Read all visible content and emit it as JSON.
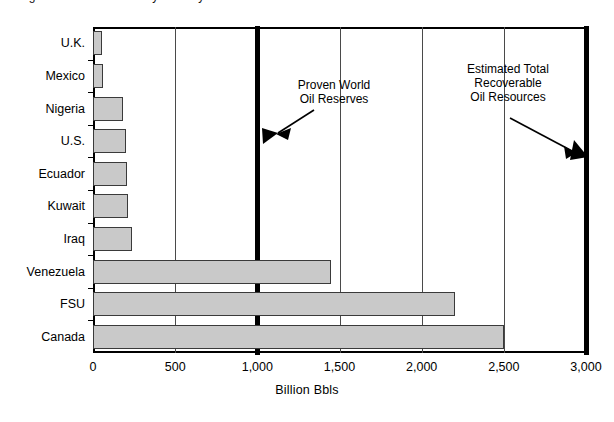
{
  "figure": {
    "title_remnant": "Figure 1.  Oil reserves by country",
    "background_color": "#ffffff"
  },
  "chart_data": {
    "type": "bar",
    "orientation": "horizontal",
    "title": "",
    "xlabel": "Billion Bbls",
    "ylabel": "",
    "categories": [
      "U.K.",
      "Mexico",
      "Nigeria",
      "U.S.",
      "Ecuador",
      "Kuwait",
      "Iraq",
      "Venezuela",
      "FSU",
      "Canada"
    ],
    "values": [
      55,
      60,
      185,
      200,
      205,
      212,
      240,
      1450,
      2200,
      2500
    ],
    "xlim": [
      0,
      3000
    ],
    "ylim": null,
    "xticks": [
      0,
      500,
      1000,
      1500,
      2000,
      2500,
      3000
    ],
    "xtick_labels": [
      "0",
      "500",
      "1,000",
      "1,500",
      "2,000",
      "2,500",
      "3,000"
    ],
    "grid": "vertical",
    "legend": null,
    "bar_fill_color": "#c9c9c9",
    "bar_edge_color": "#3a3a3a",
    "annotations": [
      {
        "name": "proven-world-oil-reserves",
        "text": "Proven World\nOil Reserves",
        "points_to_value": 1000,
        "marker_color": "#000000"
      },
      {
        "name": "estimated-total-recoverable-oil-resources",
        "text": "Estimated Total\nRecoverable\nOil Resources",
        "points_to_value": 3000,
        "marker_color": "#000000"
      }
    ]
  }
}
